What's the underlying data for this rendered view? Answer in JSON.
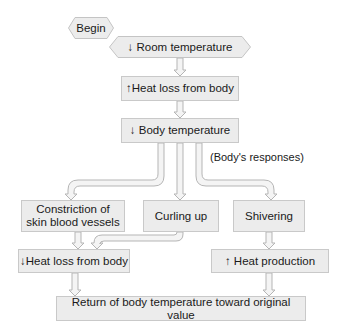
{
  "diagram": {
    "type": "flowchart",
    "start": "Begin",
    "nodes": {
      "room_temp": "↓ Room temperature",
      "heat_loss_up": "↑Heat loss from body",
      "body_temp_down": "↓ Body temperature",
      "constriction": "Constriction of skin blood vessels",
      "curling": "Curling up",
      "shivering": "Shivering",
      "heat_loss_down": "↓Heat loss from body",
      "heat_production": "↑ Heat production",
      "return": "Return of body temperature toward original value"
    },
    "annotation": "(Body's responses)",
    "edges": [
      [
        "room_temp",
        "heat_loss_up"
      ],
      [
        "heat_loss_up",
        "body_temp_down"
      ],
      [
        "body_temp_down",
        "constriction"
      ],
      [
        "body_temp_down",
        "curling"
      ],
      [
        "body_temp_down",
        "shivering"
      ],
      [
        "constriction",
        "heat_loss_down"
      ],
      [
        "curling",
        "heat_loss_down"
      ],
      [
        "shivering",
        "heat_production"
      ],
      [
        "heat_loss_down",
        "return"
      ],
      [
        "heat_production",
        "return"
      ]
    ],
    "colors": {
      "box_fill": "#ececec",
      "box_border": "#c9c9c9",
      "arrow_fill": "#f2f2f2",
      "arrow_stroke": "#b8b8b8"
    }
  }
}
